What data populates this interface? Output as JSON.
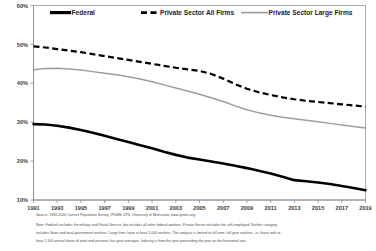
{
  "chart_data": {
    "type": "line",
    "title": "",
    "xlabel": "",
    "ylabel": "",
    "xlim": [
      1991,
      2019
    ],
    "ylim": [
      10,
      60
    ],
    "grid": false,
    "legend_position": "top",
    "ytick_labels": [
      "60%",
      "50%",
      "40%",
      "30%",
      "20%",
      "10%"
    ],
    "ytick_values": [
      60,
      50,
      40,
      30,
      20,
      10
    ],
    "xtick_labels": [
      "1991",
      "1993",
      "1995",
      "1997",
      "1999",
      "2001",
      "2003",
      "2005",
      "2007",
      "2009",
      "2011",
      "2013",
      "2015",
      "2017",
      "2019"
    ],
    "x": [
      1991,
      1992,
      1993,
      1994,
      1995,
      1996,
      1997,
      1998,
      1999,
      2000,
      2001,
      2002,
      2003,
      2004,
      2005,
      2006,
      2007,
      2008,
      2009,
      2010,
      2011,
      2012,
      2013,
      2014,
      2015,
      2016,
      2017,
      2018,
      2019
    ],
    "series": [
      {
        "name": "Federal",
        "style": "solid",
        "color": "#000000",
        "values": [
          29.5,
          29.4,
          29.1,
          28.6,
          28.0,
          27.3,
          26.5,
          25.7,
          24.9,
          24.1,
          23.3,
          22.4,
          21.6,
          20.9,
          20.4,
          19.9,
          19.4,
          18.8,
          18.2,
          17.5,
          16.8,
          16.0,
          15.1,
          14.8,
          14.5,
          14.1,
          13.6,
          13.1,
          12.5
        ]
      },
      {
        "name": "Private Sector All Firms",
        "style": "dashed",
        "color": "#000000",
        "values": [
          49.5,
          49.2,
          48.8,
          48.4,
          48.0,
          47.5,
          47.0,
          46.5,
          46.0,
          45.5,
          45.0,
          44.5,
          44.0,
          43.6,
          43.2,
          42.4,
          41.2,
          39.8,
          38.6,
          37.7,
          37.0,
          36.4,
          35.9,
          35.5,
          35.2,
          34.9,
          34.6,
          34.3,
          34.0
        ]
      },
      {
        "name": "Private Sector Large Firms",
        "style": "solid",
        "color": "#9d9d9d",
        "values": [
          43.5,
          43.8,
          43.9,
          43.7,
          43.4,
          43.0,
          42.6,
          42.2,
          41.7,
          41.1,
          40.4,
          39.6,
          38.8,
          38.0,
          37.2,
          36.3,
          35.3,
          34.2,
          33.2,
          32.4,
          31.8,
          31.3,
          30.9,
          30.5,
          30.1,
          29.7,
          29.3,
          28.9,
          28.5
        ]
      }
    ]
  },
  "legend": {
    "items": [
      {
        "label": "Federal",
        "swatch": "solid-black"
      },
      {
        "label": "Private Sector All Firms",
        "swatch": "dashed-black"
      },
      {
        "label": "Private Sector Large Firms",
        "swatch": "solid-gray"
      }
    ]
  },
  "footnotes": {
    "source": "Source: 1992-2020 Current Population Survey, IPUMS-CPS, University of Minnesota, www.ipums.org.",
    "note_line1": "Note:  Federal excludes the military and Postal Service, but includes all other federal workers.  Private Sector excludes the self-employed.  Neither category",
    "note_line2": "includes State and local government workers.  Large firms have at least 1,000 workers.  The analysis is limited to full-time, full-year workers, i.e. those with at",
    "note_line3": "least 1,500 annual hours of work and presents five-year averages.  Industry is from the year proceeding the year on the horizontal axis."
  }
}
